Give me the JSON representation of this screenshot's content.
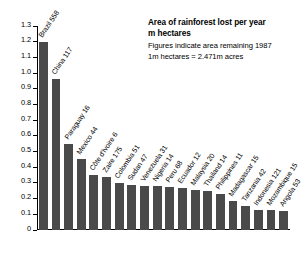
{
  "title_block": {
    "line1": "Area of rainforest lost per year",
    "line2": "m hectares",
    "line3": "Figures indicate area remaining 1987",
    "line4": "1m hectares = 2.471m acres"
  },
  "colors": {
    "bar": "#4a4a4a",
    "axis": "#000000",
    "background": "#ffffff"
  },
  "chart_data": {
    "type": "bar",
    "title": "Area of rainforest lost per year",
    "subtitle": "m hectares",
    "annotations": [
      "Figures indicate area remaining 1987",
      "1m hectares = 2.471m acres"
    ],
    "xlabel": "",
    "ylabel": "m hectares",
    "ylim": [
      0,
      1.3
    ],
    "ytick_labels": [
      "1.3",
      "1.2",
      "1.1",
      "1.0",
      "0.9",
      "0.8",
      "0.7",
      "0.6",
      "0.5",
      "0.4",
      "0.3",
      "0.2",
      "0.1",
      "0"
    ],
    "ytick_values": [
      1.3,
      1.2,
      1.1,
      1.0,
      0.9,
      0.8,
      0.7,
      0.6,
      0.5,
      0.4,
      0.3,
      0.2,
      0.1,
      0
    ],
    "grid": false,
    "legend": false,
    "categories": [
      "Brazil 558",
      "China 117",
      "Paraguay 16",
      "Mexico 44",
      "Côte d'Ivoire 6",
      "Zaire 175",
      "Colombia 51",
      "Sudan 47",
      "Venezuela 31",
      "Nigeria 14",
      "Peru 68",
      "Ecuador 12",
      "Malaysia 20",
      "Thailand 14",
      "Philippines 11",
      "Madagascar 15",
      "Tanzania 42",
      "Indonesia 121",
      "Mozambique 15",
      "Angola 53"
    ],
    "values": [
      1.2,
      0.96,
      0.55,
      0.45,
      0.35,
      0.34,
      0.3,
      0.285,
      0.28,
      0.28,
      0.275,
      0.265,
      0.255,
      0.25,
      0.23,
      0.185,
      0.15,
      0.13,
      0.125,
      0.12
    ],
    "country_labels": [
      "Brazil",
      "China",
      "Paraguay",
      "Mexico",
      "Côte d'Ivoire",
      "Zaire",
      "Colombia",
      "Sudan",
      "Venezuela",
      "Nigeria",
      "Peru",
      "Ecuador",
      "Malaysia",
      "Thailand",
      "Philippines",
      "Madagascar",
      "Tanzania",
      "Indonesia",
      "Mozambique",
      "Angola"
    ],
    "remaining_1987": [
      558,
      117,
      16,
      44,
      6,
      175,
      51,
      47,
      31,
      14,
      68,
      12,
      20,
      14,
      11,
      15,
      42,
      121,
      15,
      53
    ]
  }
}
